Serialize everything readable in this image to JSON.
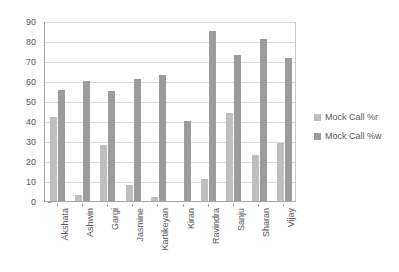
{
  "chart_data": {
    "type": "bar",
    "title": "",
    "xlabel": "",
    "ylabel": "",
    "ylim": [
      0,
      90
    ],
    "ytick_step": 10,
    "yticks": [
      0,
      10,
      20,
      30,
      40,
      50,
      60,
      70,
      80,
      90
    ],
    "ytick_labels": [
      "0",
      "10",
      "20",
      "30",
      "40",
      "50",
      "60",
      "70",
      "80",
      "90"
    ],
    "grid": "horizontal",
    "legend_position": "right",
    "categories": [
      "Akshata",
      "Ashwin",
      "Gargi",
      "Jasmine",
      "Kartikeyan",
      "Kiran",
      "Ravindra",
      "Sanju",
      "Sharan",
      "Vijay"
    ],
    "series": [
      {
        "name": "Mock Call %r",
        "color": "#bfbfbf",
        "values": [
          42,
          3,
          28,
          8,
          2,
          0,
          11,
          44,
          23,
          29
        ]
      },
      {
        "name": "Mock Call %w",
        "color": "#9c9c9c",
        "values": [
          55.5,
          60,
          55,
          61,
          63,
          40,
          85,
          73,
          81,
          71.5
        ]
      }
    ]
  },
  "legend": {
    "items": [
      {
        "label": "Mock Call %r",
        "color": "#bfbfbf"
      },
      {
        "label": "Mock Call %w",
        "color": "#9c9c9c"
      }
    ]
  }
}
